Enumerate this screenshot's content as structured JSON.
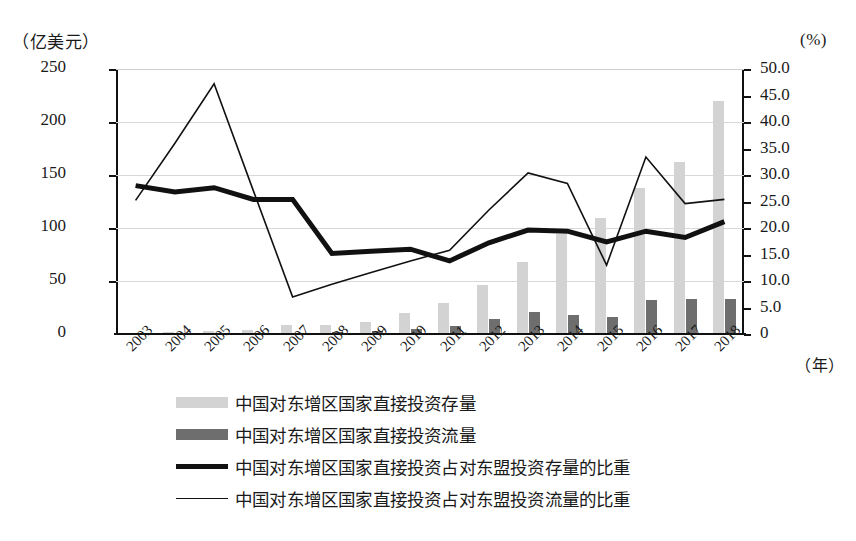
{
  "axes": {
    "left_unit": "（亿美元）",
    "right_unit": "(%)",
    "x_unit": "（年）",
    "left_ticks": [
      "250",
      "200",
      "150",
      "100",
      "50",
      "0"
    ],
    "right_ticks": [
      "50.0",
      "45.0",
      "40.0",
      "35.0",
      "30.0",
      "25.0",
      "20.0",
      "15.0",
      "10.0",
      "5.0",
      "0"
    ]
  },
  "legend": {
    "items": [
      {
        "label": "中国对东增区国家直接投资存量",
        "marker": "light-swatch"
      },
      {
        "label": "中国对东增区国家直接投资流量",
        "marker": "dark-swatch"
      },
      {
        "label": "中国对东增区国家直接投资占对东盟投资存量的比重",
        "marker": "thick-line"
      },
      {
        "label": "中国对东增区国家直接投资占对东盟投资流量的比重",
        "marker": "thin-line"
      }
    ]
  },
  "chart_data": {
    "type": "bar",
    "title": "",
    "xlabel": "（年）",
    "ylabel": "（亿美元）",
    "y2label": "(%)",
    "ylim": [
      0,
      250
    ],
    "y2lim": [
      0,
      50
    ],
    "grid": true,
    "legend_position": "bottom",
    "categories": [
      "2003",
      "2004",
      "2005",
      "2006",
      "2007",
      "2008",
      "2009",
      "2010",
      "2011",
      "2012",
      "2013",
      "2014",
      "2015",
      "2016",
      "2017",
      "2018"
    ],
    "series": [
      {
        "name": "中国对东增区国家直接投资存量",
        "type": "bar",
        "axis": "left",
        "color": "#d3d3d3",
        "values": [
          0.8,
          1.5,
          2.5,
          3.5,
          8.5,
          8.5,
          11,
          20,
          29,
          46,
          68,
          94,
          109,
          138,
          162,
          220
        ]
      },
      {
        "name": "中国对东增区国家直接投资流量",
        "type": "bar",
        "axis": "left",
        "color": "#6e6e6e",
        "values": [
          0.3,
          0.5,
          0.6,
          0.8,
          1.2,
          1.5,
          2.5,
          4.5,
          8,
          14,
          21,
          18,
          16,
          32,
          33,
          33
        ]
      },
      {
        "name": "中国对东增区国家直接投资占对东盟投资存量的比重",
        "type": "line",
        "axis": "right",
        "color": "#111111",
        "linewidth": 5,
        "values": [
          28.0,
          26.8,
          27.6,
          25.4,
          25.4,
          15.2,
          15.6,
          16.0,
          13.8,
          17.2,
          19.6,
          19.4,
          17.4,
          19.4,
          18.2,
          21.2
        ]
      },
      {
        "name": "中国对东增区国家直接投资占对东盟投资流量的比重",
        "type": "line",
        "axis": "right",
        "color": "#111111",
        "linewidth": 1.6,
        "values": [
          25.2,
          36.0,
          47.2,
          27.0,
          7.0,
          9.4,
          11.6,
          13.8,
          15.8,
          23.4,
          30.4,
          28.4,
          13.0,
          33.4,
          24.6,
          25.4
        ]
      }
    ]
  }
}
